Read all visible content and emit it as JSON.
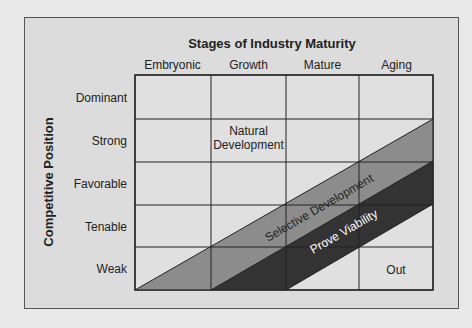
{
  "title": "Stages of Industry Maturity",
  "y_axis_label": "Competitive Position",
  "columns": [
    "Embryonic",
    "Growth",
    "Mature",
    "Aging"
  ],
  "rows": [
    "Dominant",
    "Strong",
    "Favorable",
    "Tenable",
    "Weak"
  ],
  "regions": {
    "natural": [
      "Natural",
      "Development"
    ],
    "selective": "Selective Development",
    "prove": "Prove Viability",
    "out": "Out"
  },
  "colors": {
    "panel": "#dcdcdc",
    "cell": "#dedede",
    "selective": "#8c8c8c",
    "prove": "#333333",
    "border": "#555555"
  }
}
